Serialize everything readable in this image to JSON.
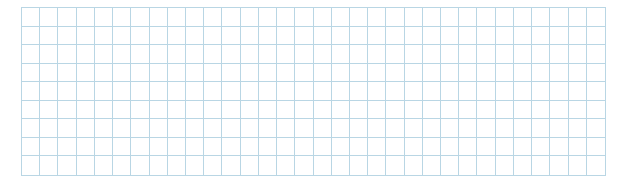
{
  "grid": {
    "columns": 32,
    "rows": 9,
    "line_color": "#b9d6e4",
    "background_color": "#ffffff"
  }
}
